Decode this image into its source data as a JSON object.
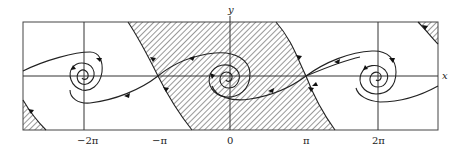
{
  "figure": {
    "type": "phase-portrait",
    "axes": {
      "x_label": "x",
      "y_label": "y",
      "x_ticks": [
        "−2π",
        "−π",
        "0",
        "π",
        "2π"
      ]
    },
    "equilibria": [
      {
        "x": "−2π",
        "type": "stable spiral"
      },
      {
        "x": "−π",
        "type": "saddle"
      },
      {
        "x": "0",
        "type": "stable spiral"
      },
      {
        "x": "π",
        "type": "saddle"
      },
      {
        "x": "2π",
        "type": "stable spiral"
      }
    ],
    "hatched_regions": [
      "basin of attraction of the spiral at 0 (central band between separatrices through −π and π)",
      "lower-left corner region",
      "upper-right corner region"
    ],
    "colors": {
      "line": "#222222",
      "background": "#ffffff",
      "hatch": "#333333"
    }
  }
}
